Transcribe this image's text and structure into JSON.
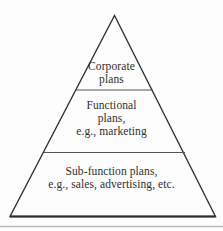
{
  "diagram": {
    "type": "pyramid",
    "levels": [
      {
        "name": "corporate-plans",
        "lines": [
          "Corporate",
          "plans"
        ]
      },
      {
        "name": "functional-plans",
        "lines": [
          "Functional",
          "plans,",
          "e.g., marketing"
        ]
      },
      {
        "name": "sub-function-plans",
        "lines": [
          "Sub-function plans,",
          "e.g., sales, advertising, etc."
        ]
      }
    ],
    "colors": {
      "background": "#fdfdfd",
      "outline_stroke": "#333333",
      "divider_stroke": "#555555",
      "base_stroke": "#2e2e2e",
      "bottom_rule": "#b8b8b8",
      "text": "#2f2f2f"
    }
  }
}
